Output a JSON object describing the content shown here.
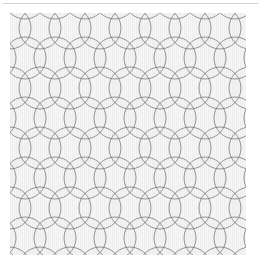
{
  "page": {
    "background_color": "#ffffff",
    "width": 262,
    "height": 269
  },
  "top_rule": {
    "name": "horizontal-rule",
    "color": "#c9c9c9",
    "x": 3,
    "y": 3,
    "width": 255,
    "height": 1
  },
  "caption": {
    "text": ""
  },
  "chart_data": {
    "type": "pattern",
    "subtitle": "",
    "motif": "overlapping-circles",
    "background_color": "#f7f7f7",
    "fill_light": "#fbfbfb",
    "fill_shade": "#eaeaea",
    "stroke_color": "#6b6b6b",
    "stroke_width": 0.9,
    "cell_width": 30,
    "cell_height": 30,
    "circle_radius": 21,
    "row_offset": 15,
    "columns": 9,
    "rows": 9,
    "swatch": {
      "x": 10,
      "y": 13,
      "width": 236,
      "height": 242
    },
    "texture": {
      "type": "vertical-hairlines",
      "spacing": 2,
      "color": "#e4e4e4"
    }
  }
}
